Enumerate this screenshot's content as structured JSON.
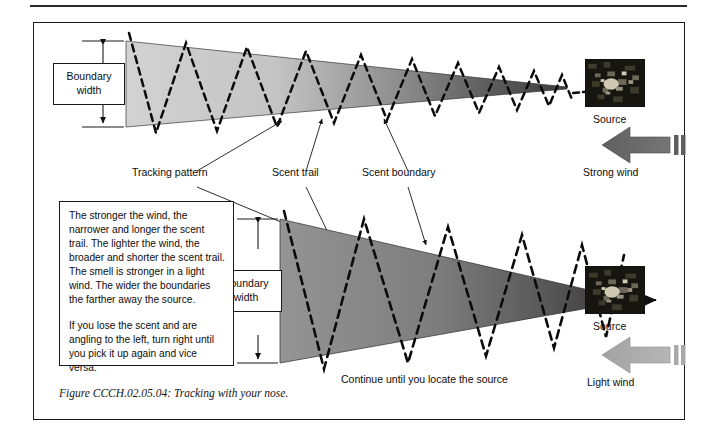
{
  "figure": {
    "caption": "Figure CCCH.02.05.04:  Tracking with your nose.",
    "top_panel": {
      "boundary_width_label_line1": "Boundary",
      "boundary_width_label_line2": "width",
      "source_label": "Source",
      "wind_label": "Strong wind",
      "source_icon": "scent-source-photo",
      "wind_arrow_icon": "left-arrow-strong-wind",
      "cone_fill_start": "#cfcfcf",
      "cone_fill_end": "#4a4a4a",
      "wind_arrow_color": "#6a6a6a"
    },
    "bottom_panel": {
      "boundary_width_label_line1": "Boundary",
      "boundary_width_label_line2": "width",
      "source_label": "Source",
      "wind_label": "Light wind",
      "instruction": "Continue until you locate the source",
      "source_icon": "scent-source-photo",
      "wind_arrow_icon": "left-arrow-light-wind",
      "cone_fill_start": "#8f8f8f",
      "cone_fill_end": "#3a3a3a",
      "wind_arrow_color": "#a9a9a9"
    },
    "callouts": [
      {
        "label": "Tracking pattern"
      },
      {
        "label": "Scent trail"
      },
      {
        "label": "Scent boundary"
      }
    ],
    "colors": {
      "ink": "#111111",
      "rule": "#2b2b2b",
      "dash": "#0b0b0b"
    }
  }
}
